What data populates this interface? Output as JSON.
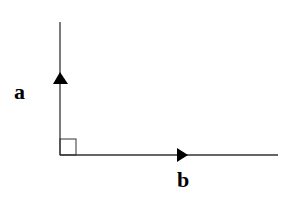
{
  "diagram": {
    "title": "",
    "vectors": [
      {
        "name": "a",
        "label": "a",
        "direction": "up",
        "from": [
          60,
          155
        ],
        "to": [
          60,
          22
        ]
      },
      {
        "name": "b",
        "label": "b",
        "direction": "right",
        "from": [
          60,
          155
        ],
        "to": [
          278,
          155
        ]
      }
    ],
    "right_angle_marker": true,
    "colors": {
      "line": "#333333",
      "arrow": "#000000",
      "background": "#ffffff"
    }
  }
}
